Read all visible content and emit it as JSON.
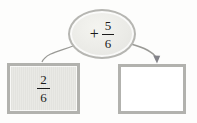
{
  "diagram": {
    "type": "fraction-addition-flow",
    "operation": {
      "operator": "+",
      "numerator": "5",
      "denominator": "6"
    },
    "input": {
      "numerator": "2",
      "denominator": "6"
    },
    "answer": {
      "value": ""
    }
  },
  "icons": {
    "left_connector": "curved-line-down-left",
    "right_connector": "curved-arrow-down-right"
  },
  "colors": {
    "background": "#fdfdfc",
    "shape_border": "#b3b3af",
    "ellipse_fill": "#ecece8",
    "input_box_fill": "#e6e6e2",
    "answer_box_fill": "#ffffff",
    "arrow": "#9a9a96",
    "arrowhead": "#84848a",
    "text": "#1b1b1b"
  }
}
